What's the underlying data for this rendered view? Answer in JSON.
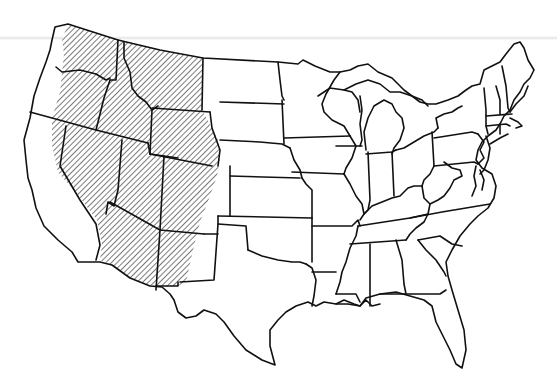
{
  "map": {
    "subject": "Contiguous United States outline map",
    "style": "black-and-white line drawing",
    "shaded_region": {
      "pattern": "diagonal-hatch",
      "description": "Western interior region (Rocky Mountain / Intermontane West), excluding the Pacific coastal strip and the eastern Great Plains portions of Montana, Wyoming, Colorado and New Mexico",
      "states_fully_or_partly_hatched": [
        "Washington (east)",
        "Oregon (east)",
        "California (east)",
        "Idaho",
        "Nevada",
        "Montana (west)",
        "Wyoming",
        "Utah",
        "Colorado (west)",
        "Arizona",
        "New Mexico (west)"
      ]
    },
    "colors": {
      "background": "#ffffff",
      "outline": "#111111",
      "hatch": "#333333"
    },
    "labels": []
  }
}
